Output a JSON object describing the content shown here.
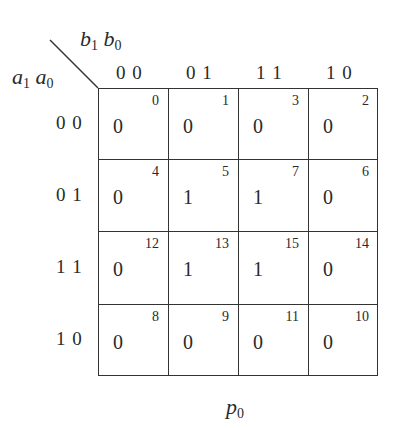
{
  "map": {
    "col_var": {
      "v1": "b",
      "s1": "1",
      "v2": "b",
      "s2": "0"
    },
    "row_var": {
      "v1": "a",
      "s1": "1",
      "v2": "a",
      "s2": "0"
    },
    "col_labels": [
      "0 0",
      "0 1",
      "1 1",
      "1 0"
    ],
    "row_labels": [
      "0 0",
      "0 1",
      "1 1",
      "1 0"
    ],
    "cells": [
      [
        {
          "value": "0",
          "index": "0"
        },
        {
          "value": "0",
          "index": "1"
        },
        {
          "value": "0",
          "index": "3"
        },
        {
          "value": "0",
          "index": "2"
        }
      ],
      [
        {
          "value": "0",
          "index": "4"
        },
        {
          "value": "1",
          "index": "5"
        },
        {
          "value": "1",
          "index": "7"
        },
        {
          "value": "0",
          "index": "6"
        }
      ],
      [
        {
          "value": "0",
          "index": "12"
        },
        {
          "value": "1",
          "index": "13"
        },
        {
          "value": "1",
          "index": "15"
        },
        {
          "value": "0",
          "index": "14"
        }
      ],
      [
        {
          "value": "0",
          "index": "8"
        },
        {
          "value": "0",
          "index": "9"
        },
        {
          "value": "0",
          "index": "11"
        },
        {
          "value": "0",
          "index": "10"
        }
      ]
    ],
    "caption": {
      "v": "p",
      "s": "0"
    }
  }
}
